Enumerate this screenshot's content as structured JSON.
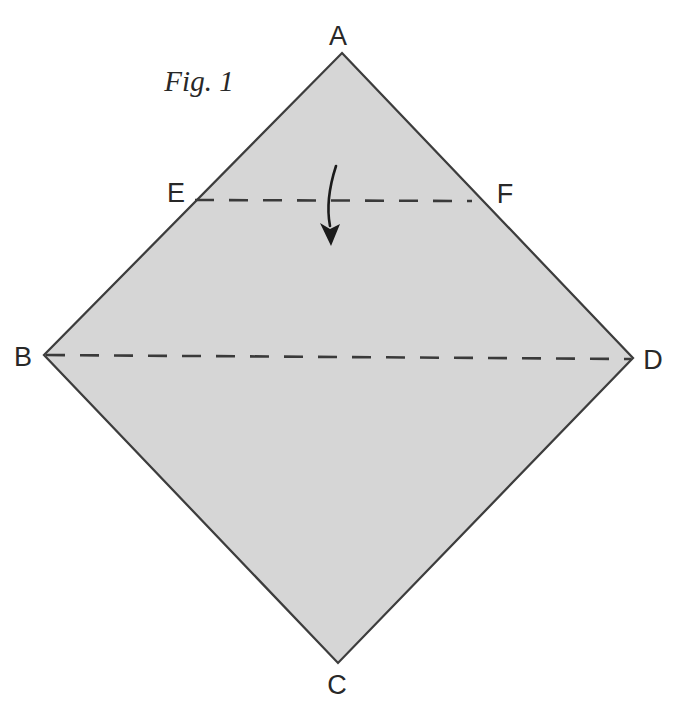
{
  "figure": {
    "caption": "Fig. 1",
    "labels": {
      "a": "A",
      "b": "B",
      "c": "C",
      "d": "D",
      "e": "E",
      "f": "F"
    }
  },
  "colors": {
    "background": "#ffffff",
    "paper_fill": "#d6d6d6",
    "paper_outline": "#3d3d3d",
    "fold_line": "#3a3a3a",
    "arrow": "#1b1b1b",
    "label_text": "#282828"
  }
}
